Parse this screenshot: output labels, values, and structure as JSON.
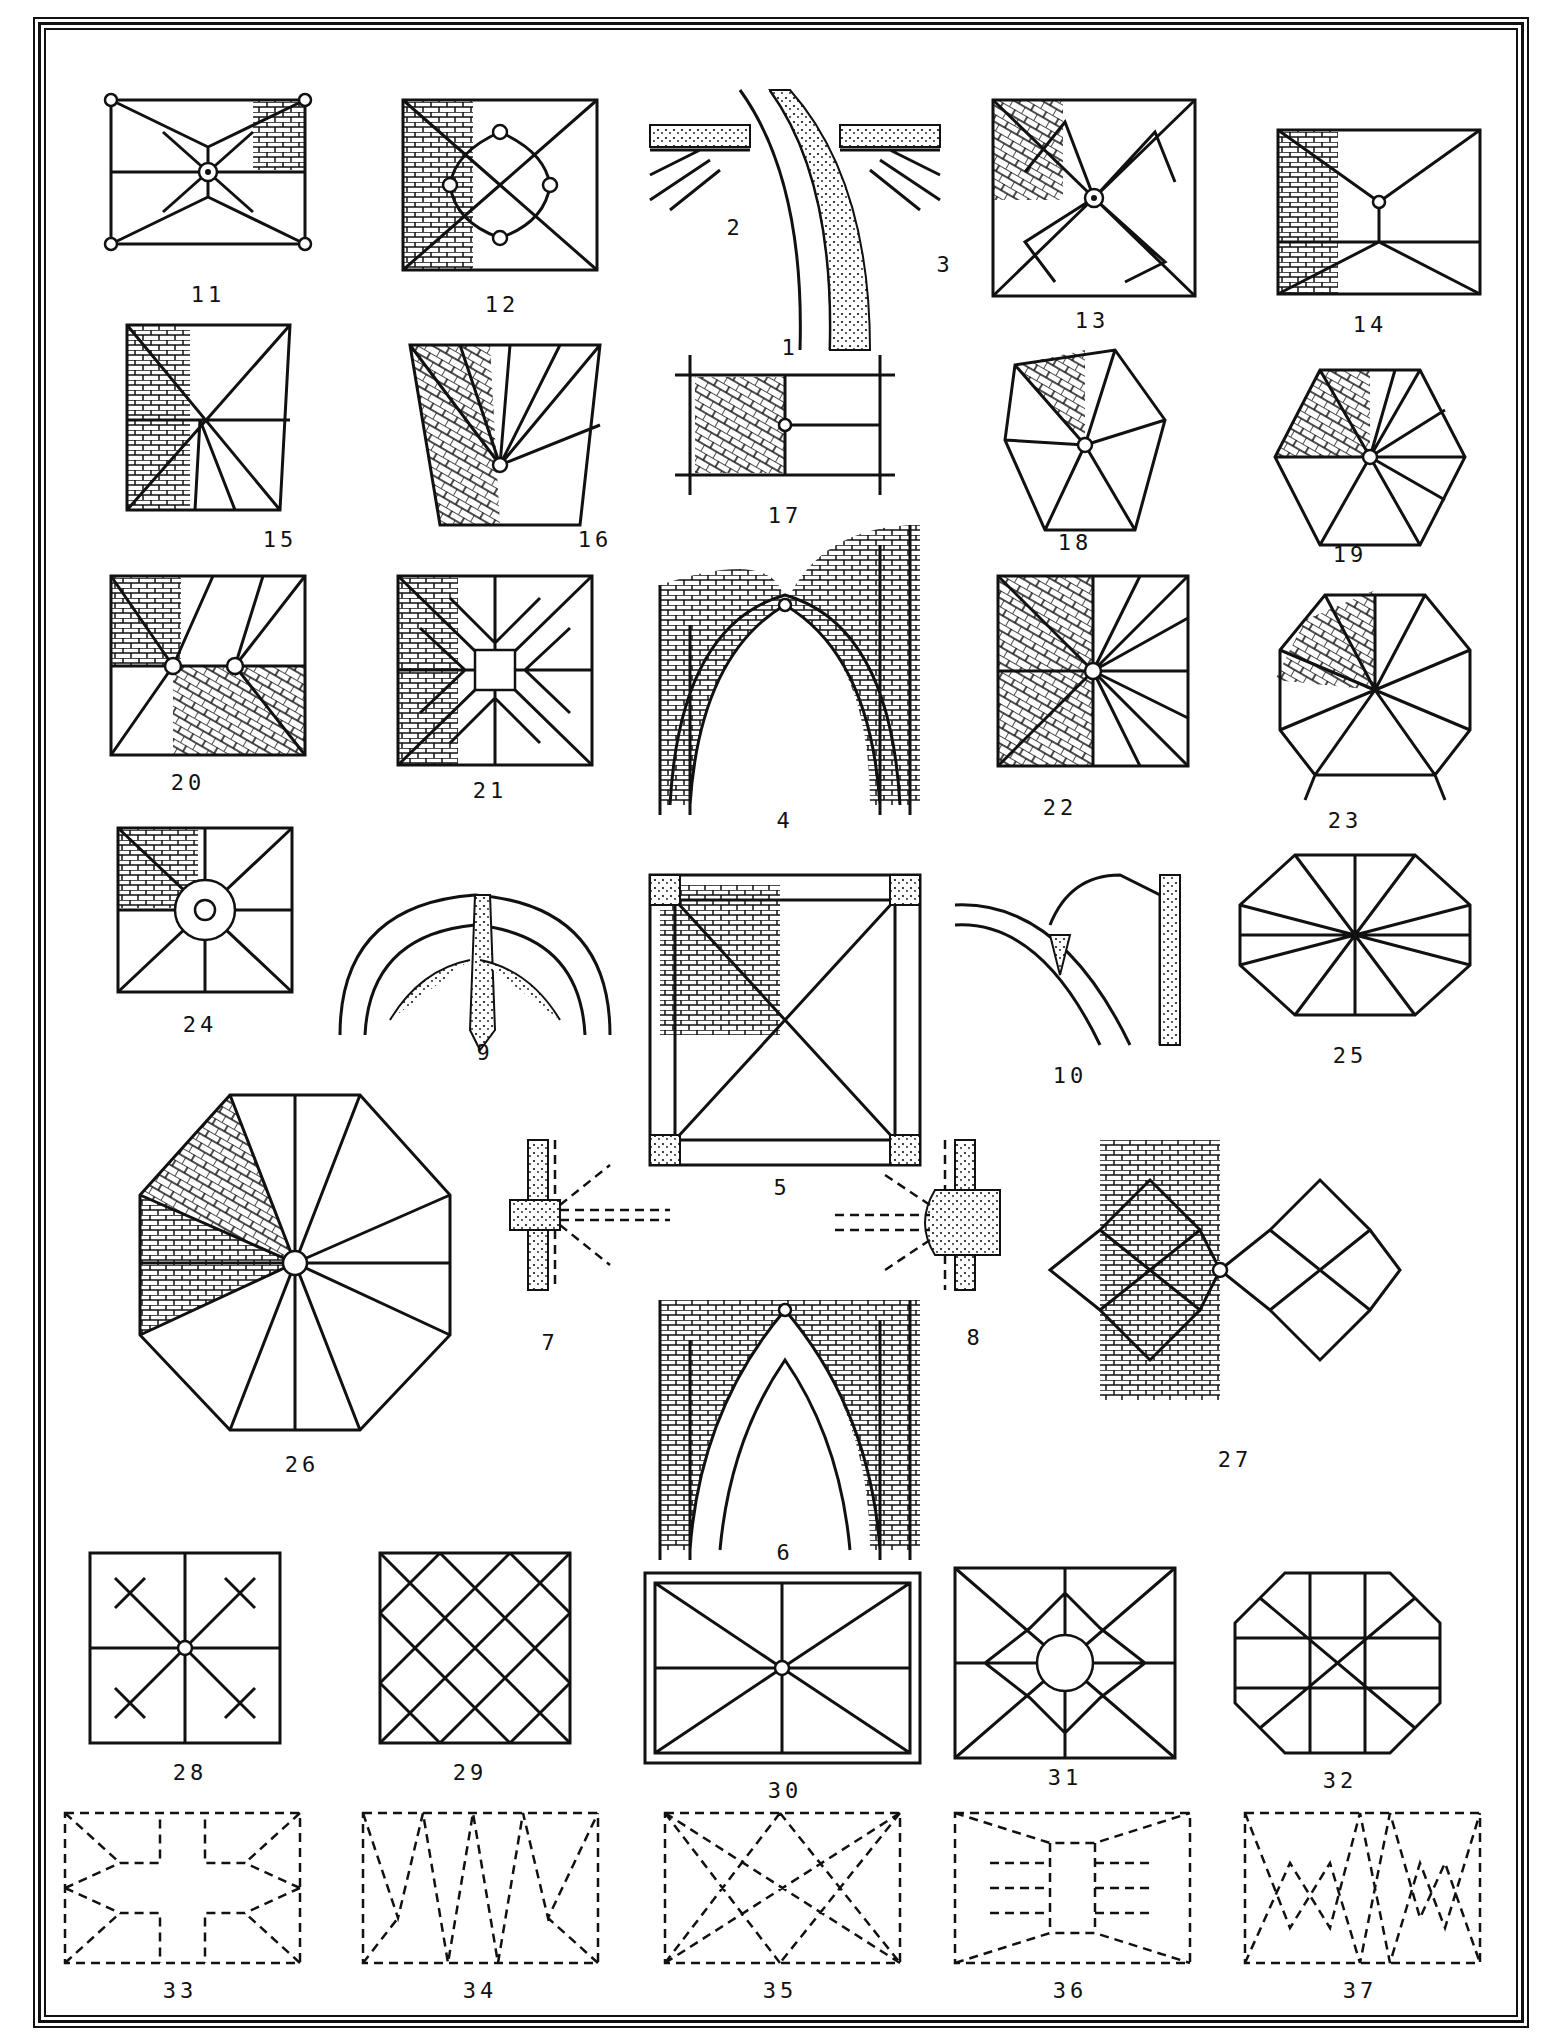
{
  "page": {
    "title": "",
    "border": "triple-ruled frame"
  },
  "figures": [
    {
      "id": "fig-1",
      "label": "1",
      "type": "section",
      "description": "arch rib springing from capital with rubble backing"
    },
    {
      "id": "fig-2",
      "label": "2",
      "type": "section",
      "description": "wall rib springing, left"
    },
    {
      "id": "fig-3",
      "label": "3",
      "type": "section",
      "description": "wall rib springing, right"
    },
    {
      "id": "fig-4",
      "label": "4",
      "type": "elevation",
      "description": "pointed arch with ribbed vault webbing"
    },
    {
      "id": "fig-5",
      "label": "5",
      "type": "plan",
      "description": "quadripartite bay with diagonal ribs and corner piers"
    },
    {
      "id": "fig-6",
      "label": "6",
      "type": "elevation",
      "description": "pointed arch with double rib"
    },
    {
      "id": "fig-7",
      "label": "7",
      "type": "plan",
      "description": "pier with ribs a, b, c",
      "letters": [
        "b",
        "a",
        "c",
        "a",
        "b"
      ]
    },
    {
      "id": "fig-8",
      "label": "8",
      "type": "plan",
      "description": "clustered pier with ribs a, b, c",
      "letters": [
        "b",
        "a",
        "c",
        "a",
        "b"
      ]
    },
    {
      "id": "fig-9",
      "label": "9",
      "type": "section",
      "description": "arch with pendant rib"
    },
    {
      "id": "fig-10",
      "label": "10",
      "type": "section",
      "description": "rib springing with webbing"
    },
    {
      "id": "fig-11",
      "label": "11",
      "type": "plan",
      "description": "quadripartite vault with ridge ribs and tiercerons"
    },
    {
      "id": "fig-12",
      "label": "12",
      "type": "plan",
      "description": "vault with curved liernes"
    },
    {
      "id": "fig-13",
      "label": "13",
      "type": "plan",
      "description": "star vault with tiercerons and liernes"
    },
    {
      "id": "fig-14",
      "label": "14",
      "type": "plan",
      "description": "sexpartite-style vault with ridge rib"
    },
    {
      "id": "fig-15",
      "label": "15",
      "type": "plan",
      "description": "trapezoidal bay vault"
    },
    {
      "id": "fig-16",
      "label": "16",
      "type": "plan",
      "description": "fan of ribs over trapezoidal bay"
    },
    {
      "id": "fig-17",
      "label": "17",
      "type": "plan",
      "description": "rectangular bay with herringbone webbing"
    },
    {
      "id": "fig-18",
      "label": "18",
      "type": "plan",
      "description": "pentagonal apse vault"
    },
    {
      "id": "fig-19",
      "label": "19",
      "type": "plan",
      "description": "hexagonal vault"
    },
    {
      "id": "fig-20",
      "label": "20",
      "type": "plan",
      "description": "double-bossed vault"
    },
    {
      "id": "fig-21",
      "label": "21",
      "type": "plan",
      "description": "lierne vault with square and octagon panels"
    },
    {
      "id": "fig-22",
      "label": "22",
      "type": "plan",
      "description": "square radial vault"
    },
    {
      "id": "fig-23",
      "label": "23",
      "type": "plan",
      "description": "polygonal apse radial vault"
    },
    {
      "id": "fig-24",
      "label": "24",
      "type": "plan",
      "description": "vault with central ring boss"
    },
    {
      "id": "fig-25",
      "label": "25",
      "type": "plan",
      "description": "octagonal star vault"
    },
    {
      "id": "fig-26",
      "label": "26",
      "type": "plan",
      "description": "octagonal chapter-house vault"
    },
    {
      "id": "fig-27",
      "label": "27",
      "type": "plan",
      "description": "net vault with lozenge panels"
    },
    {
      "id": "fig-28",
      "label": "28",
      "type": "plan",
      "description": "four-panel star lierne vault"
    },
    {
      "id": "fig-29",
      "label": "29",
      "type": "plan",
      "description": "diagonal net vault"
    },
    {
      "id": "fig-30",
      "label": "30",
      "type": "plan",
      "description": "oblong vault with ridge rib and bosses"
    },
    {
      "id": "fig-31",
      "label": "31",
      "type": "plan",
      "description": "stellar vault with central roundel"
    },
    {
      "id": "fig-32",
      "label": "32",
      "type": "plan",
      "description": "octagonal net vault"
    },
    {
      "id": "fig-33",
      "label": "33",
      "type": "dashed-plan",
      "description": "rib pattern, cross-shaped centre"
    },
    {
      "id": "fig-34",
      "label": "34",
      "type": "dashed-plan",
      "description": "rib pattern, zigzag"
    },
    {
      "id": "fig-35",
      "label": "35",
      "type": "dashed-plan",
      "description": "rib pattern, crossing diagonals"
    },
    {
      "id": "fig-36",
      "label": "36",
      "type": "dashed-plan",
      "description": "rib pattern, ladder centre"
    },
    {
      "id": "fig-37",
      "label": "37",
      "type": "dashed-plan",
      "description": "rib pattern, double zigzag"
    }
  ],
  "colors": {
    "ink": "#111111",
    "paper": "#ffffff"
  }
}
